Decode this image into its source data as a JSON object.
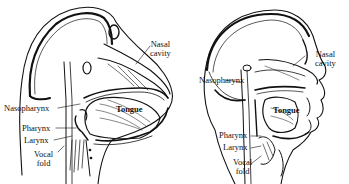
{
  "figure": {
    "panels": [
      {
        "id": "left",
        "subject": "non-human primate vocal tract",
        "labels": {
          "nasal_cavity_1": "Nasal",
          "nasal_cavity_2": "cavity",
          "nasopharynx": "Nasopharynx",
          "tongue": "Tongue",
          "pharynx": "Pharynx",
          "larynx": "Larynx",
          "vocal_fold_1": "Vocal",
          "vocal_fold_2": "fold"
        }
      },
      {
        "id": "right",
        "subject": "human vocal tract",
        "labels": {
          "nasal_cavity_1": "Nasal",
          "nasal_cavity_2": "cavity",
          "nasopharynx": "Nasopharynx",
          "tongue": "Tongue",
          "pharynx": "Pharynx",
          "larynx": "Larynx",
          "vocal_fold_1": "Vocal",
          "vocal_fold_2": "fold"
        }
      }
    ],
    "colors": {
      "ink": "#111111",
      "background": "#ffffff"
    }
  }
}
